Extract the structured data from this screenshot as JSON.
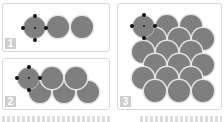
{
  "panels": [
    {
      "label": "1",
      "description": "Single row of three circles, first selected"
    },
    {
      "label": "2",
      "description": "Two staggered rows of circles, first selected"
    },
    {
      "label": "3",
      "description": "Full overlapping scale pattern grid, top-left circle selected"
    }
  ],
  "colors": {
    "circle": "#7f7f7f",
    "border": "#d9d9d9",
    "badge": "#cfcfcf",
    "handle": "#111111"
  }
}
